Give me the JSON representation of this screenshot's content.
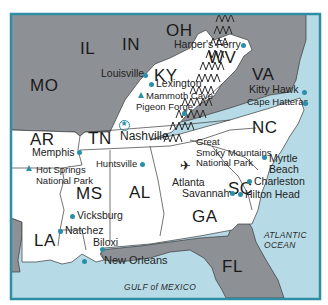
{
  "map": {
    "colors": {
      "frame": "#2f8ea3",
      "ocean": "#b7dbe6",
      "highlight_state": "#ffffff",
      "other_state": "#8d9094",
      "border_line": "#3a3a3a",
      "marker": "#2a8fa8"
    },
    "states": [
      {
        "abbr": "MO"
      },
      {
        "abbr": "IL"
      },
      {
        "abbr": "IN"
      },
      {
        "abbr": "OH"
      },
      {
        "abbr": "KY"
      },
      {
        "abbr": "WV"
      },
      {
        "abbr": "VA"
      },
      {
        "abbr": "AR"
      },
      {
        "abbr": "TN"
      },
      {
        "abbr": "NC"
      },
      {
        "abbr": "SC"
      },
      {
        "abbr": "MS"
      },
      {
        "abbr": "AL"
      },
      {
        "abbr": "GA"
      },
      {
        "abbr": "LA"
      },
      {
        "abbr": "FL"
      }
    ],
    "cities": [
      {
        "name": "Louisville",
        "marker": "dot"
      },
      {
        "name": "Lexington",
        "marker": "dot"
      },
      {
        "name": "Harper's Ferry",
        "marker": "dot"
      },
      {
        "name": "Kitty Hawk",
        "marker": "dot"
      },
      {
        "name": "Cape Hatteras",
        "marker": "dot"
      },
      {
        "name": "Pigeon Forge",
        "marker": "dot"
      },
      {
        "name": "Nashville",
        "marker": "capital-star"
      },
      {
        "name": "Memphis",
        "marker": "dot"
      },
      {
        "name": "Huntsville",
        "marker": "dot"
      },
      {
        "name": "Atlanta",
        "marker": "airport"
      },
      {
        "name": "Savannah",
        "marker": "dot"
      },
      {
        "name": "Myrtle Beach",
        "marker": "dot"
      },
      {
        "name": "Charleston",
        "marker": "dot"
      },
      {
        "name": "Hilton Head",
        "marker": "dot"
      },
      {
        "name": "Vicksburg",
        "marker": "dot"
      },
      {
        "name": "Natchez",
        "marker": "dot"
      },
      {
        "name": "Biloxi",
        "marker": "dot"
      },
      {
        "name": "New Orleans",
        "marker": "dot"
      }
    ],
    "parks": [
      {
        "name": "Mammoth Cave",
        "marker": "triangle"
      },
      {
        "name": "Hot Springs National Park",
        "line1": "Hot Springs",
        "line2": "National Park",
        "marker": "triangle"
      },
      {
        "name": "Great Smoky Mountains National Park",
        "line1": "Great",
        "line2": "Smoky Mountains",
        "line3": "National Park"
      }
    ],
    "water": [
      {
        "name": "ATLANTIC OCEAN",
        "line1": "ATLANTIC",
        "line2": "OCEAN"
      },
      {
        "name": "GULF of MEXICO"
      }
    ]
  }
}
